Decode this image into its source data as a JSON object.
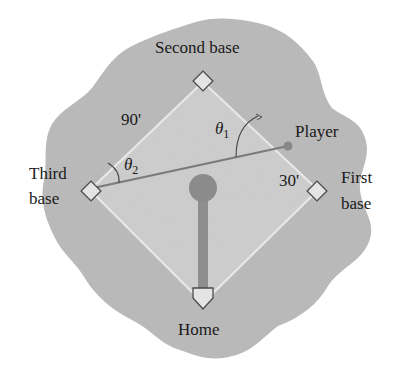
{
  "diagram": {
    "type": "baseball-diamond",
    "colors": {
      "background": "#ffffff",
      "outfield": "#b8b8b8",
      "infield": "#cfcfcf",
      "baseline": "#e6e6e6",
      "mound": "#8f8f8f",
      "base_fill": "#e4e4e4",
      "base_stroke": "#4a4a4a",
      "player_line": "#7d7d7d",
      "player_dot": "#8a8a8a",
      "text": "#1a1a1a"
    },
    "labels": {
      "second_base": "Second base",
      "third_base_line1": "Third",
      "third_base_line2": "base",
      "first_base_line1": "First",
      "first_base_line2": "base",
      "home": "Home",
      "player": "Player",
      "side_length": "90'",
      "player_distance": "30'",
      "theta1_symbol": "θ",
      "theta1_sub": "1",
      "theta2_symbol": "θ",
      "theta2_sub": "2"
    },
    "geometry": {
      "home": [
        203,
        303
      ],
      "first_base": [
        318,
        190
      ],
      "second_base": [
        203,
        82
      ],
      "third_base": [
        90,
        190
      ],
      "player": [
        288,
        146
      ],
      "mound_center": [
        203,
        188
      ],
      "mound_radius": 14
    }
  }
}
